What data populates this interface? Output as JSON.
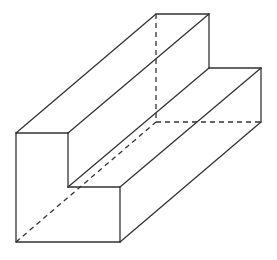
{
  "figure": {
    "stroke_color": "#333333",
    "background": "#ffffff",
    "front_face": [
      [
        16,
        133
      ],
      [
        68,
        133
      ],
      [
        68,
        187
      ],
      [
        120,
        187
      ],
      [
        120,
        242
      ],
      [
        16,
        242
      ]
    ],
    "back_face": [
      [
        156,
        14
      ],
      [
        209,
        14
      ],
      [
        209,
        68
      ],
      [
        261,
        68
      ],
      [
        261,
        122
      ],
      [
        156,
        122
      ]
    ],
    "solid_edges": [
      [
        16,
        133,
        68,
        133
      ],
      [
        68,
        133,
        68,
        187
      ],
      [
        68,
        187,
        120,
        187
      ],
      [
        120,
        187,
        120,
        242
      ],
      [
        120,
        242,
        16,
        242
      ],
      [
        16,
        242,
        16,
        133
      ],
      [
        156,
        14,
        209,
        14
      ],
      [
        209,
        14,
        209,
        68
      ],
      [
        209,
        68,
        261,
        68
      ],
      [
        261,
        68,
        261,
        122
      ],
      [
        16,
        133,
        156,
        14
      ],
      [
        68,
        133,
        209,
        14
      ],
      [
        68,
        187,
        209,
        68
      ],
      [
        120,
        187,
        261,
        68
      ],
      [
        120,
        242,
        261,
        122
      ]
    ],
    "hidden_edges": [
      [
        156,
        14,
        156,
        122
      ],
      [
        156,
        122,
        261,
        122
      ],
      [
        16,
        242,
        156,
        122
      ]
    ]
  }
}
